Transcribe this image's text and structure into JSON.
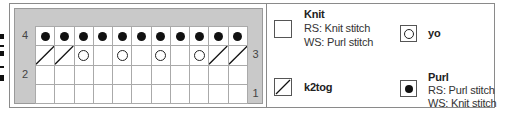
{
  "chart": {
    "columns": 11,
    "rows": [
      {
        "number": "4",
        "side": "left",
        "stitches": [
          "purl",
          "purl",
          "purl",
          "purl",
          "purl",
          "purl",
          "purl",
          "purl",
          "purl",
          "purl",
          "purl"
        ]
      },
      {
        "number": "3",
        "side": "right",
        "stitches": [
          "k2tog",
          "k2tog",
          "yo",
          "knit",
          "yo",
          "knit",
          "yo",
          "knit",
          "yo",
          "k2tog",
          "k2tog"
        ]
      },
      {
        "number": "2",
        "side": "left",
        "stitches": [
          "knit",
          "knit",
          "knit",
          "knit",
          "knit",
          "knit",
          "knit",
          "knit",
          "knit",
          "knit",
          "knit"
        ]
      },
      {
        "number": "1",
        "side": "right",
        "stitches": [
          "knit",
          "knit",
          "knit",
          "knit",
          "knit",
          "knit",
          "knit",
          "knit",
          "knit",
          "knit",
          "knit"
        ]
      }
    ]
  },
  "legend": {
    "knit": {
      "title": "Knit",
      "rs": "RS: Knit stitch",
      "ws": "WS: Purl stitch"
    },
    "yo": {
      "title": "yo"
    },
    "k2tog": {
      "title": "k2tog"
    },
    "purl": {
      "title": "Purl",
      "rs": "RS: Purl stitch",
      "ws": "WS: Knit stitch"
    }
  },
  "colors": {
    "chart_bg": "#c9c9c9",
    "grid_line": "#aaaaaa",
    "symbol": "#111111"
  }
}
